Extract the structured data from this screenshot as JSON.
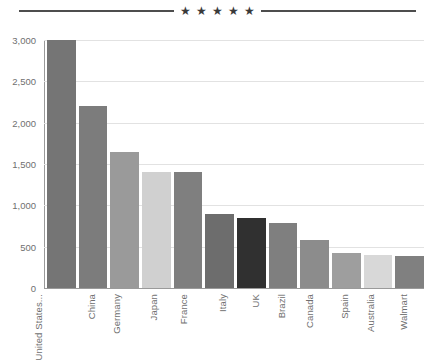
{
  "header": {
    "stars": [
      "star-1",
      "star-2",
      "star-3",
      "star-4",
      "star-5"
    ],
    "star_glyph": "★",
    "rule_color": "#4d4d4d"
  },
  "chart_data": {
    "type": "bar",
    "title": "",
    "subtitle": "",
    "xlabel": "",
    "ylabel": "",
    "categories": [
      "United States...",
      "China",
      "Germany",
      "Japan",
      "France",
      "Italy",
      "UK",
      "Brazil",
      "Canada",
      "Spain",
      "Australia",
      "Walmart"
    ],
    "values": [
      3000,
      2200,
      1650,
      1400,
      1400,
      900,
      850,
      790,
      580,
      420,
      400,
      390
    ],
    "bar_colors": [
      "#757575",
      "#7c7c7c",
      "#9a9a9a",
      "#d0d0d0",
      "#7f7f7f",
      "#6d6d6d",
      "#303030",
      "#7f7f7f",
      "#8c8c8c",
      "#9e9e9e",
      "#d8d8d8",
      "#808080"
    ],
    "ylim": [
      0,
      3000
    ],
    "yticks": [
      0,
      500,
      1000,
      1500,
      2000,
      2500,
      3000
    ],
    "ytick_labels": [
      "0",
      "500",
      "1,000",
      "1,500",
      "2,000",
      "2,500",
      "3,000"
    ],
    "grid": true,
    "legend": "none",
    "axis_color": "#9a9a9a",
    "grid_color": "#e2e2e2",
    "tick_label_color": "#6f6f6f"
  }
}
